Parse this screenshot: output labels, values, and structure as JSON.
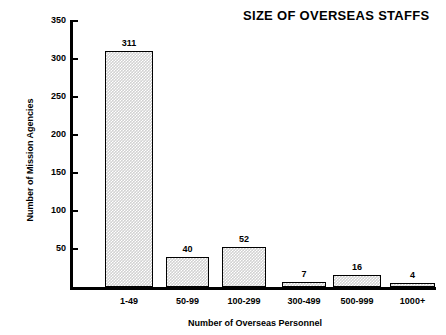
{
  "chart_data": {
    "type": "bar",
    "title": "SIZE OF OVERSEAS STAFFS",
    "xlabel": "Number of Overseas Personnel",
    "ylabel": "Number of Mission Agencies",
    "categories": [
      "1-49",
      "50-99",
      "100-299",
      "300-499",
      "500-999",
      "1000+"
    ],
    "values": [
      311,
      40,
      52,
      7,
      16,
      4
    ],
    "value_labels": [
      "311",
      "40",
      "52",
      "7",
      "16",
      "4"
    ],
    "ylim": [
      0,
      350
    ],
    "yticks": [
      50,
      100,
      150,
      200,
      250,
      300,
      350
    ],
    "ytick_labels": [
      "50",
      "100",
      "150",
      "200",
      "250",
      "300",
      "350"
    ],
    "grid": false,
    "legend": false,
    "bar_fill": "#d2d2d2",
    "bar_edge": "#000000",
    "background": "#ffffff"
  }
}
